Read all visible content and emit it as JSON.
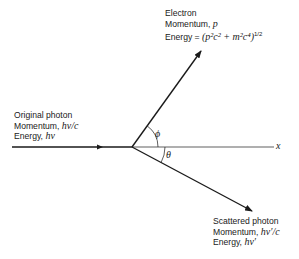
{
  "diagram": {
    "electron": {
      "line1": "Electron",
      "line2_label": "Momentum, ",
      "line2_sym": "p",
      "line3_label": "Energy = ",
      "line3_formula": "(p²c² + m²c⁴)",
      "line3_exp": "1/2"
    },
    "original_photon": {
      "line1": "Original photon",
      "line2_label": "Momentum, ",
      "line2_sym": "hν/c",
      "line3_label": "Energy, ",
      "line3_sym": "hν"
    },
    "scattered_photon": {
      "line1": "Scattered photon",
      "line2_label": "Momentum, ",
      "line2_sym": "hν′/c",
      "line3_label": "Energy, ",
      "line3_sym": "hν′"
    },
    "angles": {
      "phi": "ϕ",
      "theta": "θ"
    },
    "axis_label": "x",
    "colors": {
      "ink": "#1a1a1a"
    }
  }
}
